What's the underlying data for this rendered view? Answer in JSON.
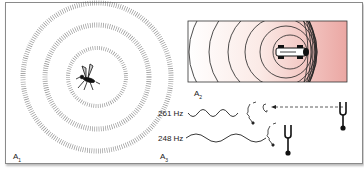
{
  "figure": {
    "panels": [
      {
        "id": "A1",
        "label": "A",
        "sub": "1",
        "description": "Mosquito emitting sound waves as concentric dotted rings"
      },
      {
        "id": "A2",
        "label": "A",
        "sub": "2",
        "description": "Moving car with sound wavefronts compressed ahead (Doppler effect)"
      },
      {
        "id": "A3",
        "label": "A",
        "sub": "3",
        "description": "Two frequencies heard by listener from moving tuning fork"
      }
    ],
    "frequencies": [
      {
        "label": "261 Hz"
      },
      {
        "label": "248 Hz"
      }
    ],
    "colors": {
      "frame": "#8a8a8a",
      "gradient_end": "#e8a0a0",
      "line": "#1a1a1a"
    }
  }
}
